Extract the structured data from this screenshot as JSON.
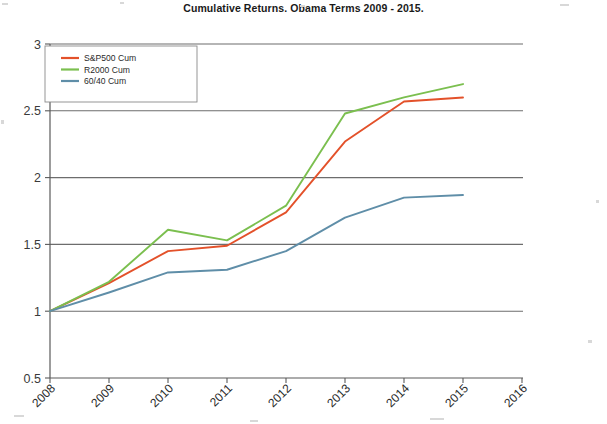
{
  "chart_data": {
    "type": "line",
    "title": "Cumulative Returns. Obama Terms 2009 - 2015.",
    "xlabel": "",
    "ylabel": "",
    "x": [
      2008,
      2009,
      2010,
      2011,
      2012,
      2013,
      2014,
      2015
    ],
    "categories": [
      "2008",
      "2009",
      "2010",
      "2011",
      "2012",
      "2013",
      "2014",
      "2015"
    ],
    "xtick_labels": [
      "2008",
      "2009",
      "2010",
      "2011",
      "2012",
      "2013",
      "2014",
      "2015",
      "2016"
    ],
    "xlim": [
      2008,
      2016
    ],
    "ylim": [
      0.5,
      3
    ],
    "ytick_labels": [
      "0.5",
      "1",
      "1.5",
      "2",
      "2.5",
      "3"
    ],
    "ytick_values": [
      0.5,
      1,
      1.5,
      2,
      2.5,
      3
    ],
    "grid": true,
    "legend_position": "top-left",
    "series": [
      {
        "name": "S&P500 Cum",
        "color": "#e3512a",
        "values": [
          1.0,
          1.21,
          1.45,
          1.49,
          1.74,
          2.27,
          2.57,
          2.6
        ]
      },
      {
        "name": "R2000 Cum",
        "color": "#7bbf4f",
        "values": [
          1.0,
          1.22,
          1.61,
          1.53,
          1.79,
          2.48,
          2.6,
          2.7
        ]
      },
      {
        "name": "60/40 Cum",
        "color": "#5f8ea8",
        "values": [
          1.0,
          1.14,
          1.29,
          1.31,
          1.45,
          1.7,
          1.85,
          1.87
        ]
      }
    ]
  },
  "legend": {
    "items": [
      {
        "label": "S&P500 Cum",
        "color": "#e3512a"
      },
      {
        "label": "R2000 Cum",
        "color": "#7bbf4f"
      },
      {
        "label": "60/40 Cum",
        "color": "#5f8ea8"
      }
    ]
  }
}
